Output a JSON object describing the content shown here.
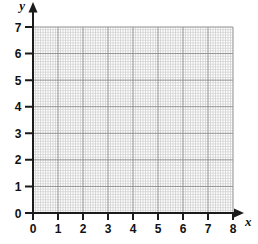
{
  "page": {
    "background": "#ffffff"
  },
  "figure": {
    "axis_color": "#1b1b1b",
    "minor_grid_color": "#c9c9c9",
    "major_grid_color": "#8f8f8f",
    "text_color": "#111111"
  },
  "chart_data": {
    "type": "scatter",
    "series": [],
    "title": "",
    "xlabel": "x",
    "ylabel": "y",
    "xlim": [
      0,
      8
    ],
    "ylim": [
      0,
      7
    ],
    "x_ticks": [
      0,
      1,
      2,
      3,
      4,
      5,
      6,
      7,
      8
    ],
    "y_ticks": [
      0,
      1,
      2,
      3,
      4,
      5,
      6,
      7
    ],
    "minor_divisions_per_unit": 10,
    "grid": "on",
    "legend": "none",
    "annotations": []
  }
}
